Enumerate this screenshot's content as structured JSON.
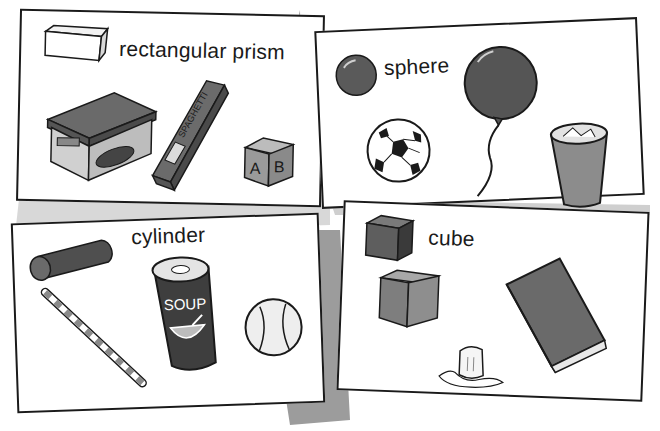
{
  "illustration": {
    "subject": "Solid shapes and everyday examples",
    "background_color": "#a8a8a8",
    "card_color": "#ffffff",
    "ink_color": "#1a1a1a"
  },
  "cards": [
    {
      "id": "rectangular-prism",
      "label": "rectangular prism",
      "examples": [
        {
          "name": "shoe box",
          "text": ""
        },
        {
          "name": "spaghetti box",
          "text": "SPAGHETTI"
        },
        {
          "name": "alphabet block",
          "text": "A B"
        }
      ]
    },
    {
      "id": "sphere",
      "label": "sphere",
      "examples": [
        {
          "name": "soccer ball"
        },
        {
          "name": "balloon"
        },
        {
          "name": "trash can"
        }
      ]
    },
    {
      "id": "cylinder",
      "label": "cylinder",
      "examples": [
        {
          "name": "drinking straw"
        },
        {
          "name": "soup can",
          "text": "SOUP"
        },
        {
          "name": "baseball"
        }
      ]
    },
    {
      "id": "cube",
      "label": "cube",
      "examples": [
        {
          "name": "wooden block"
        },
        {
          "name": "ice cube"
        },
        {
          "name": "book"
        }
      ]
    }
  ]
}
